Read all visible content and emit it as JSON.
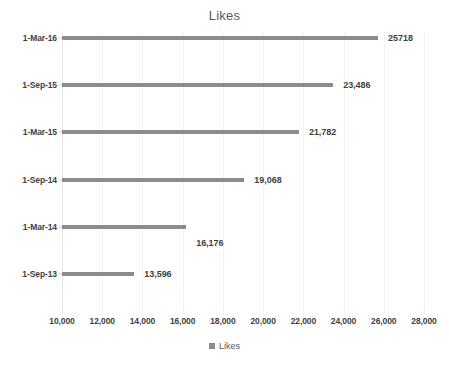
{
  "chart_data": {
    "type": "bar",
    "orientation": "horizontal",
    "title": "Likes",
    "xlabel": "",
    "ylabel": "",
    "categories": [
      "1-Sep-13",
      "1-Mar-14",
      "1-Sep-14",
      "1-Mar-15",
      "1-Sep-15",
      "1-Mar-16"
    ],
    "values": [
      13596,
      16176,
      19068,
      21782,
      23486,
      25718
    ],
    "data_labels": [
      "13,596",
      "16,176",
      "19,068",
      "21,782",
      "23,486",
      "25718"
    ],
    "series": [
      {
        "name": "Likes",
        "values": [
          13596,
          16176,
          19068,
          21782,
          23486,
          25718
        ],
        "color": "#8c8c8c"
      }
    ],
    "xlim": [
      10000,
      28000
    ],
    "xticks": [
      10000,
      12000,
      14000,
      16000,
      18000,
      20000,
      22000,
      24000,
      26000,
      28000
    ],
    "xtick_labels": [
      "10,000",
      "12,000",
      "14,000",
      "16,000",
      "18,000",
      "20,000",
      "22,000",
      "24,000",
      "26,000",
      "28,000"
    ],
    "grid": true,
    "grid_axis": "x",
    "legend": {
      "position": "bottom",
      "entries": [
        {
          "label": "Likes",
          "color": "#8c8c8c",
          "marker": "square-swatch-icon"
        }
      ]
    },
    "colors": {
      "bar": "#8c8c8c",
      "gridline": "#f2f2f2",
      "title_text": "#595959",
      "axis_text": "#3f3f3f",
      "background": "#ffffff"
    }
  }
}
